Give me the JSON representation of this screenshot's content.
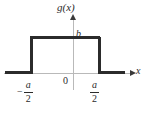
{
  "figure": {
    "kind": "rectangular-pulse-plot",
    "function_label": "g(x)",
    "axis_x_label": "x",
    "axis_y_value_label": "b",
    "origin_label": "0",
    "ticks": {
      "left": {
        "sign": "−",
        "numerator": "a",
        "denominator": "2"
      },
      "right": {
        "sign": "",
        "numerator": "a",
        "denominator": "2"
      }
    },
    "colors": {
      "curve": "#2b2b2b",
      "axis": "#b9b9b9",
      "arrow": "#3a3a3a",
      "background": "#ffffff",
      "text": "#2b2b2b"
    }
  },
  "chart_data": {
    "type": "line",
    "title": "",
    "subtitle": "",
    "xlabel": "x",
    "ylabel": "g(x)",
    "grid": false,
    "legend": null,
    "xlim": [
      -1.0,
      1.0
    ],
    "ylim": [
      0,
      1.25
    ],
    "xticks": [
      "-a/2",
      "0",
      "a/2"
    ],
    "xtick_values": [
      -0.5,
      0,
      0.5
    ],
    "yticks": [
      "b"
    ],
    "ytick_values": [
      1.0
    ],
    "series": [
      {
        "name": "g(x)",
        "x": [
          -1.0,
          -0.5,
          -0.5,
          0.5,
          0.5,
          1.0
        ],
        "values": [
          0,
          0,
          1.0,
          1.0,
          0,
          0
        ]
      }
    ],
    "annotations": [
      {
        "text": "g(x)",
        "x": 0.0,
        "y": 1.25
      },
      {
        "text": "b",
        "x": 0.04,
        "y": 1.0
      },
      {
        "text": "0",
        "x": -0.08,
        "y": -0.1
      },
      {
        "text": "x",
        "x": 1.0,
        "y": -0.05
      }
    ]
  }
}
